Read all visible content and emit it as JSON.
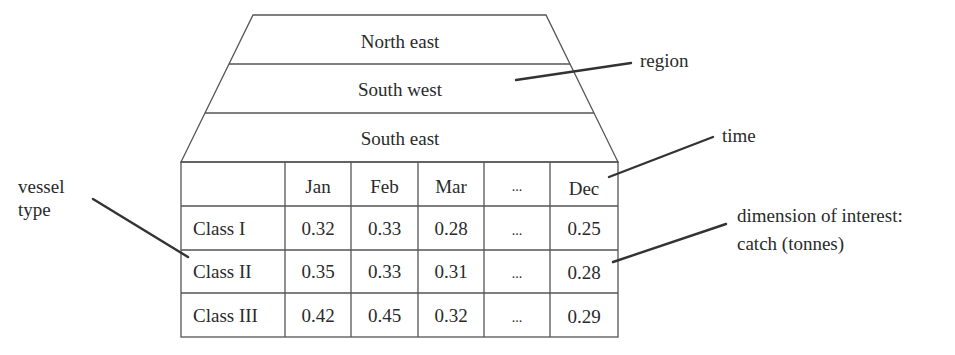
{
  "diagram": {
    "type": "data-cube-illustration",
    "regions": [
      "North east",
      "South west",
      "South east"
    ],
    "table": {
      "columns": [
        "",
        "Jan",
        "Feb",
        "Mar",
        "...",
        "Dec"
      ],
      "rows": [
        {
          "label": "Class I",
          "values": [
            "0.32",
            "0.33",
            "0.28",
            "...",
            "0.25"
          ]
        },
        {
          "label": "Class II",
          "values": [
            "0.35",
            "0.33",
            "0.31",
            "...",
            "0.28"
          ]
        },
        {
          "label": "Class III",
          "values": [
            "0.42",
            "0.45",
            "0.32",
            "...",
            "0.29"
          ]
        }
      ]
    },
    "annotations": {
      "region": "region",
      "time": "time",
      "vessel_line1": "vessel",
      "vessel_line2": "type",
      "measure_line1": "dimension of interest:",
      "measure_line2": "catch (tonnes)"
    },
    "colors": {
      "line": "#555555",
      "pointer": "#333333",
      "text": "#2a2a2a",
      "background": "#ffffff"
    }
  }
}
